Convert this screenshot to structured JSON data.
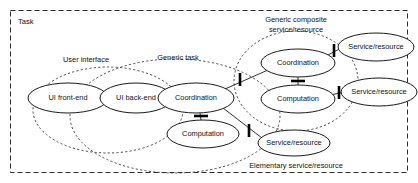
{
  "diagram": {
    "title": "Task",
    "frame": {
      "label": "Task"
    },
    "nodes": [
      {
        "id": "ui-front-end",
        "label": "UI front-end",
        "cx": 68,
        "cy": 98,
        "rx": 40,
        "ry": 15
      },
      {
        "id": "ui-back-end",
        "label": "UI back-end",
        "cx": 136,
        "cy": 98,
        "rx": 36,
        "ry": 15
      },
      {
        "id": "coordination-main",
        "label": "Coordination",
        "cx": 196,
        "cy": 98,
        "rx": 38,
        "ry": 15
      },
      {
        "id": "computation-main",
        "label": "Computation",
        "cx": 203,
        "cy": 134,
        "rx": 36,
        "ry": 14
      },
      {
        "id": "coordination-comp",
        "label": "Coordination",
        "cx": 298,
        "cy": 63,
        "rx": 37,
        "ry": 14
      },
      {
        "id": "computation-comp",
        "label": "Computation",
        "cx": 298,
        "cy": 99,
        "rx": 37,
        "ry": 14
      },
      {
        "id": "service-top",
        "label": "Service/resource",
        "cx": 376,
        "cy": 47,
        "rx": 38,
        "ry": 14
      },
      {
        "id": "service-mid",
        "label": "Service/resource",
        "cx": 379,
        "cy": 92,
        "rx": 38,
        "ry": 14
      },
      {
        "id": "service-bottom",
        "label": "Service/resource",
        "cx": 294,
        "cy": 143,
        "rx": 36,
        "ry": 13
      }
    ],
    "groups": [
      {
        "id": "user-interface",
        "label": "User interface",
        "cx": 108,
        "cy": 110,
        "rx": 75,
        "ry": 43,
        "label_x": 86,
        "label_y": 62
      },
      {
        "id": "generic-task",
        "label": "Generic task",
        "cx": 175,
        "cy": 116,
        "rx": 105,
        "ry": 57,
        "label_x": 178,
        "label_y": 60
      },
      {
        "id": "generic-composite",
        "label": "Generic composite\nservice/resource",
        "cx": 296,
        "cy": 81,
        "rx": 62,
        "ry": 50,
        "label_x": 296,
        "label_y": 22
      },
      {
        "id": "elementary-service-label",
        "label": "Elementary service/resource",
        "label_x": 296,
        "label_y": 168
      }
    ],
    "group_labels": [
      {
        "id": "user-interface-label",
        "text": "User interface",
        "x": 86,
        "y": 62
      },
      {
        "id": "generic-task-label",
        "text": "Generic task",
        "x": 178,
        "y": 60
      },
      {
        "id": "composite-label-line1",
        "text": "Generic composite",
        "x": 296,
        "y": 22
      },
      {
        "id": "composite-label-line2",
        "text": "service/resource",
        "x": 296,
        "y": 32
      },
      {
        "id": "elementary-label",
        "text": "Elementary service/resource",
        "x": 296,
        "y": 168
      }
    ],
    "connectors": [
      {
        "id": "ui-front-to-back",
        "from": "ui-front-end",
        "to": "ui-back-end"
      },
      {
        "id": "ui-back-to-coordination",
        "from": "ui-back-end",
        "to": "coordination-main"
      },
      {
        "id": "coordination-to-computation-main",
        "from": "coordination-main",
        "to": "computation-main"
      },
      {
        "id": "coordination-main-to-composite",
        "from": "coordination-main",
        "to": "coordination-comp"
      },
      {
        "id": "coordination-main-to-service-bottom",
        "from": "coordination-main",
        "to": "service-bottom"
      },
      {
        "id": "coordination-comp-to-computation-comp",
        "from": "coordination-comp",
        "to": "computation-comp"
      },
      {
        "id": "coordination-comp-to-service-top",
        "from": "coordination-comp",
        "to": "service-top"
      },
      {
        "id": "computation-comp-to-service-mid",
        "from": "computation-comp",
        "to": "service-mid"
      }
    ],
    "colors": {
      "node_stroke": "#1a1a1a",
      "group_stroke": "#3a3a3a",
      "frame_stroke": "#2a2a2a",
      "background": "#ffffff",
      "text": "#111111"
    }
  }
}
